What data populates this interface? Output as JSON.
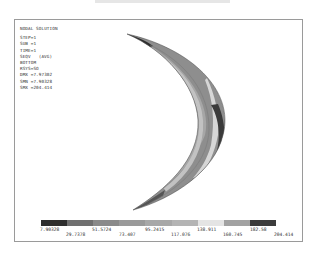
{
  "info": {
    "title": "NODAL SOLUTION",
    "lines": [
      "STEP=1",
      "SUB =1",
      "TIME=1"
    ],
    "result": "SEQV",
    "avg": "(AVG)",
    "layer": "BOTTOM",
    "rsys": "RSYS=SO",
    "dmx": "DMX =7.97302",
    "smn": "SMN =7.90328",
    "smx": "SMX =204.414"
  },
  "legend": {
    "colors": [
      "#2e2e2e",
      "#707070",
      "#8a8a8a",
      "#9a9a9a",
      "#a8a8a8",
      "#b4b4b4",
      "#e4e4e4",
      "#a2a2a2",
      "#3c3c3c"
    ],
    "labels_top": [
      "7.90328",
      "51.5724",
      "95.2415",
      "138.911",
      "182.58"
    ],
    "labels_bottom": [
      "29.7378",
      "73.407",
      "117.076",
      "160.745",
      "204.414"
    ]
  }
}
